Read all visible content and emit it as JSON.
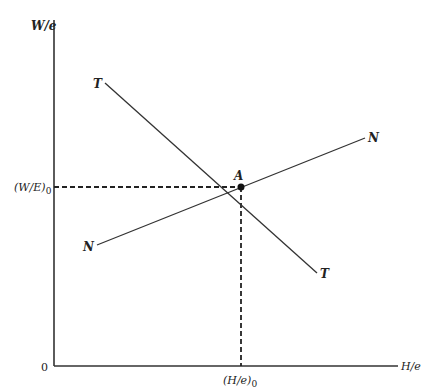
{
  "diagram": {
    "type": "economic-equilibrium-diagram",
    "axes": {
      "y_label": "W/e",
      "x_label": "H/e",
      "origin_label": "0"
    },
    "curves": [
      {
        "name": "T",
        "start_label": "T",
        "end_label": "T",
        "slope": "negative"
      },
      {
        "name": "N",
        "start_label": "N",
        "end_label": "N",
        "slope": "positive"
      }
    ],
    "equilibrium": {
      "label": "A",
      "y_value_label": "(W/E)",
      "y_value_subscript": "0",
      "x_value_label": "(H/e)",
      "x_value_subscript": "0"
    },
    "colors": {
      "line": "#333333",
      "background": "#ffffff"
    }
  }
}
